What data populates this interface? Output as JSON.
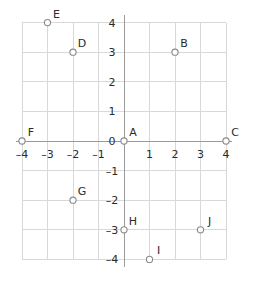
{
  "chart_data": {
    "type": "scatter",
    "title": "",
    "xlabel": "",
    "ylabel": "",
    "xlim": [
      -4,
      4
    ],
    "ylim": [
      -4,
      4
    ],
    "grid": true,
    "legend": "none",
    "x_ticks": [
      "-4",
      "-3",
      "-2",
      "-1",
      "1",
      "2",
      "3",
      "4"
    ],
    "y_ticks": [
      "4",
      "3",
      "2",
      "1",
      "0",
      "-1",
      "-2",
      "-3",
      "-4"
    ],
    "origin_label": "0",
    "points": [
      {
        "label": "A",
        "x": 0,
        "y": 0
      },
      {
        "label": "B",
        "x": 2,
        "y": 3
      },
      {
        "label": "C",
        "x": 4,
        "y": 0
      },
      {
        "label": "D",
        "x": -2,
        "y": 3
      },
      {
        "label": "E",
        "x": -3,
        "y": 4
      },
      {
        "label": "F",
        "x": -4,
        "y": 0
      },
      {
        "label": "G",
        "x": -2,
        "y": -2
      },
      {
        "label": "H",
        "x": 0,
        "y": -3
      },
      {
        "label": "I",
        "x": 1,
        "y": -4
      },
      {
        "label": "J",
        "x": 3,
        "y": -3
      }
    ],
    "colors": {
      "grid": "#d8d8d8",
      "axis": "#9a9a9a",
      "point_stroke": "#8a8a8a",
      "point_fill": "#ffffff",
      "text": "#2b2b2b",
      "background": "#ffffff"
    }
  }
}
